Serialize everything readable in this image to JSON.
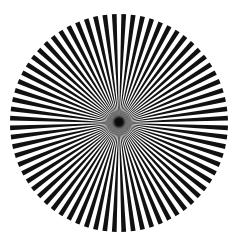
{
  "image": {
    "subject": "Siemens star test pattern",
    "pattern": {
      "spoke_count": 72,
      "spoke_color": "#111111",
      "gap_color": "#ffffff",
      "background": "#ffffff",
      "center_color": "#0a0a0a"
    }
  }
}
